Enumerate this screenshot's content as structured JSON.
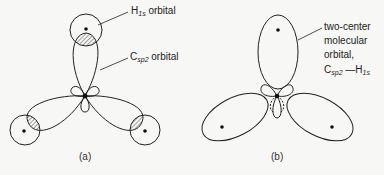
{
  "panel_a": {
    "caption": "(a)",
    "labels": {
      "h_orbital": {
        "main": "H",
        "sub": "1s",
        "rest": " orbital"
      },
      "c_orbital": {
        "main": "C",
        "sub": "sp2",
        "rest": " orbital"
      }
    }
  },
  "panel_b": {
    "caption": "(b)",
    "label_lines": [
      "two-center",
      "molecular",
      "orbital,"
    ],
    "bond_label": {
      "c_main": "C",
      "c_sub": "sp2",
      "dash": " —",
      "h_main": "H",
      "h_sub": "1s"
    }
  },
  "colors": {
    "line": "#222222",
    "background": "#f7f7f5"
  }
}
